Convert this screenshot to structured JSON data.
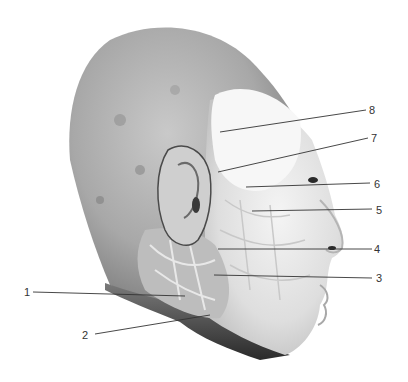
{
  "figure": {
    "colors": {
      "background": "#ffffff",
      "leader_line": "#333333",
      "label_text": "#333333"
    }
  },
  "labels": [
    {
      "id": "1",
      "text": "1",
      "x": 24,
      "y": 286,
      "line": [
        33,
        292,
        185,
        296
      ]
    },
    {
      "id": "2",
      "text": "2",
      "x": 82,
      "y": 329,
      "line": [
        95,
        334,
        210,
        315
      ]
    },
    {
      "id": "3",
      "text": "3",
      "x": 376,
      "y": 272,
      "line": [
        214,
        275,
        372,
        278
      ]
    },
    {
      "id": "4",
      "text": "4",
      "x": 374,
      "y": 243,
      "line": [
        218,
        249,
        372,
        249
      ]
    },
    {
      "id": "5",
      "text": "5",
      "x": 376,
      "y": 204,
      "line": [
        252,
        211,
        372,
        209
      ]
    },
    {
      "id": "6",
      "text": "6",
      "x": 374,
      "y": 178,
      "line": [
        246,
        187,
        370,
        183
      ]
    },
    {
      "id": "7",
      "text": "7",
      "x": 371,
      "y": 132,
      "line": [
        218,
        172,
        368,
        138
      ]
    },
    {
      "id": "8",
      "text": "8",
      "x": 369,
      "y": 104,
      "line": [
        220,
        132,
        366,
        110
      ]
    }
  ]
}
